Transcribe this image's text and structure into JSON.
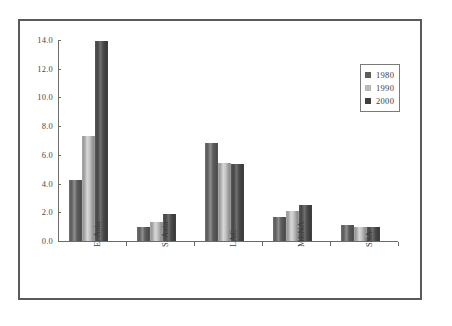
{
  "chart_data": {
    "type": "bar",
    "title": "",
    "subtitle": "",
    "xlabel": "",
    "ylabel": "",
    "categories": [
      "E. Asia",
      "S. Asia",
      "LAC",
      "MENA",
      "SSA"
    ],
    "series": [
      {
        "name": "1980",
        "color": "#5e5e5e",
        "values": [
          4.25,
          0.95,
          6.8,
          1.65,
          1.1
        ]
      },
      {
        "name": "1990",
        "color": "#b9b9b9",
        "values": [
          7.3,
          1.35,
          5.4,
          2.1,
          1.0
        ]
      },
      {
        "name": "2000",
        "color": "#3f3f3f",
        "values": [
          13.95,
          1.85,
          5.35,
          2.5,
          0.95
        ]
      }
    ],
    "ylim": [
      0.0,
      14.0
    ],
    "ytick_step": 2.0,
    "yticks": [
      "0.0",
      "2.0",
      "4.0",
      "6.0",
      "8.0",
      "10.0",
      "12.0",
      "14.0"
    ],
    "grid": false,
    "legend_position": "upper-right",
    "legend_entries": [
      "1980",
      "1990",
      "2000"
    ]
  },
  "legend": {
    "items": [
      {
        "label": "1980"
      },
      {
        "label": "1990"
      },
      {
        "label": "2000"
      }
    ]
  },
  "axes": {
    "y_ticks": [
      "14.0",
      "12.0",
      "10.0",
      "8.0",
      "6.0",
      "4.0",
      "2.0",
      "0.0"
    ],
    "x_categories": [
      "E. Asia",
      "S. Asia",
      "LAC",
      "MENA",
      "SSA"
    ]
  }
}
